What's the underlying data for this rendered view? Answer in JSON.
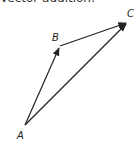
{
  "caption": "Vector addition:",
  "points": {
    "A": {
      "label": "A",
      "x": 25,
      "y": 125
    },
    "B": {
      "label": "B",
      "x": 60,
      "y": 46
    },
    "C": {
      "label": "C",
      "x": 128,
      "y": 22
    }
  },
  "vectors": [
    {
      "from": "A",
      "to": "B"
    },
    {
      "from": "B",
      "to": "C"
    },
    {
      "from": "A",
      "to": "C"
    }
  ],
  "stroke_color": "#222222"
}
